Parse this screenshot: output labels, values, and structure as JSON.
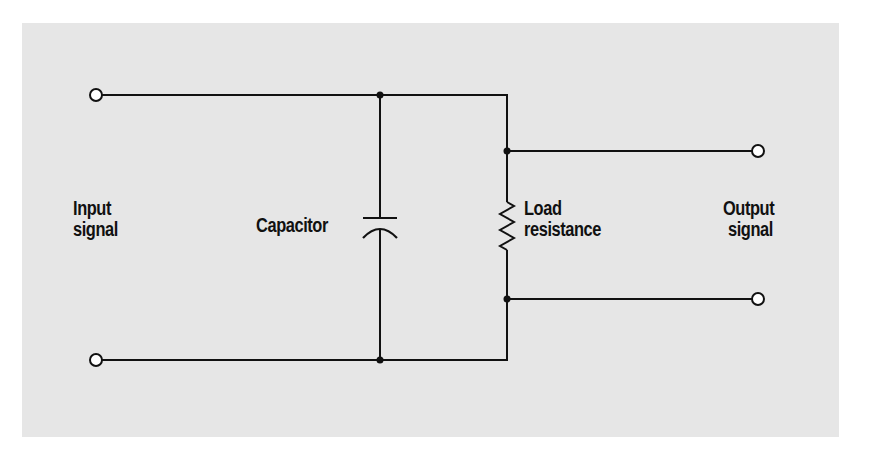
{
  "diagram": {
    "type": "RC low-pass filter circuit",
    "colors": {
      "panel_background": "#e6e6e6",
      "page_background": "#ffffff",
      "wire": "#111111"
    },
    "labels": {
      "input_line1": "Input",
      "input_line2": "signal",
      "capacitor": "Capacitor",
      "load_line1": "Load",
      "load_line2": "resistance",
      "output_line1": "Output",
      "output_line2": "signal"
    },
    "components": [
      {
        "name": "Capacitor",
        "symbol": "capacitor",
        "orientation": "vertical"
      },
      {
        "name": "Load resistance",
        "symbol": "resistor-zigzag",
        "orientation": "vertical"
      }
    ],
    "terminals": [
      {
        "name": "input-top",
        "x": 96,
        "y": 95
      },
      {
        "name": "input-bottom",
        "x": 96,
        "y": 360
      },
      {
        "name": "output-top",
        "x": 758,
        "y": 151
      },
      {
        "name": "output-bottom",
        "x": 758,
        "y": 299
      }
    ],
    "junctions": [
      {
        "x": 380,
        "y": 95
      },
      {
        "x": 380,
        "y": 360
      },
      {
        "x": 507,
        "y": 151
      },
      {
        "x": 507,
        "y": 299
      }
    ]
  }
}
